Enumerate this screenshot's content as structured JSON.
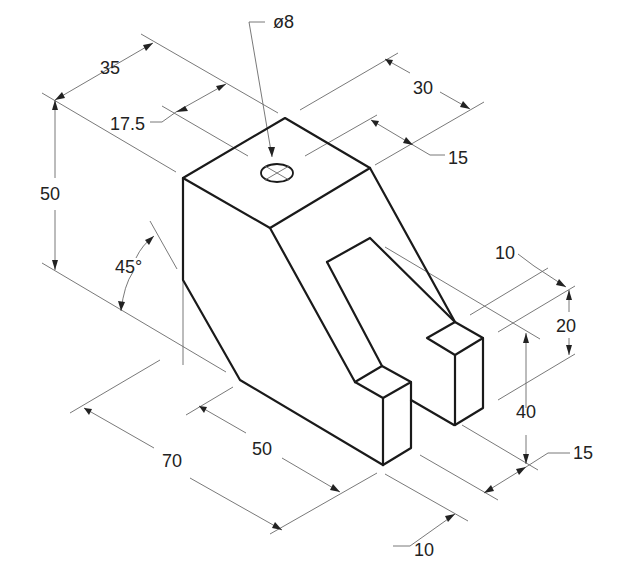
{
  "drawing": {
    "type": "isometric technical drawing",
    "colors": {
      "object_line": "#1a1a1a",
      "dimension_line": "#6a6a6a",
      "background": "#ffffff"
    },
    "dimensions": {
      "hole_diameter": "ø8",
      "width_top": "35",
      "half_width": "17.5",
      "height_total": "50",
      "angle": "45°",
      "depth_top": "30",
      "depth_half": "15",
      "prong_height_upper": "10",
      "prong_height": "20",
      "slot_depth_height": "40",
      "slot_width": "15",
      "length_total": "70",
      "length_lower": "50",
      "prong_width": "10"
    }
  }
}
